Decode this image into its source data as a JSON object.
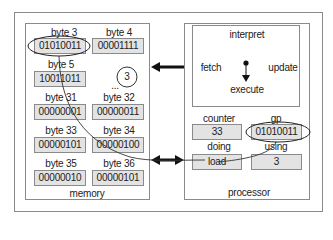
{
  "memory": {
    "title": "memory",
    "cells": [
      {
        "label": "byte 3",
        "value": "01010011"
      },
      {
        "label": "byte 4",
        "value": "00001111"
      },
      {
        "label": "byte 5",
        "value": "10011011"
      },
      {
        "label": "byte 31",
        "value": "00000001"
      },
      {
        "label": "byte 32",
        "value": "00000011"
      },
      {
        "label": "byte 33",
        "value": "00000101"
      },
      {
        "label": "byte 34",
        "value": "00000100"
      },
      {
        "label": "byte 35",
        "value": "00000010"
      },
      {
        "label": "byte 36",
        "value": "00000101"
      }
    ],
    "ellipsis": "...",
    "callout": "3"
  },
  "processor": {
    "title": "processor",
    "cycle": {
      "top": "interpret",
      "left": "fetch",
      "right": "update",
      "bottom": "execute"
    },
    "registers": [
      {
        "label": "counter",
        "value": "33"
      },
      {
        "label": "gp",
        "value": "01010011"
      },
      {
        "label": "doing",
        "value": "load"
      },
      {
        "label": "using",
        "value": "3"
      }
    ]
  },
  "arrows": {
    "top": "processor-to-memory",
    "bottom": "bidirectional"
  }
}
